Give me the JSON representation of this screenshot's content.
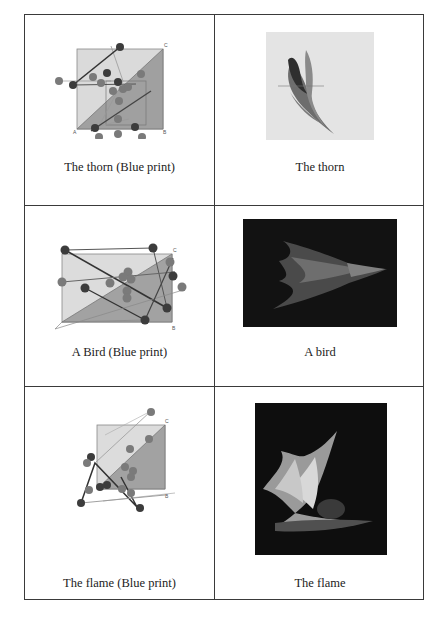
{
  "rows": [
    {
      "blueprint": {
        "caption": "The thorn (Blue print)",
        "icon": "blueprint-diagram"
      },
      "render": {
        "caption": "The thorn",
        "icon": "fractal-thorn-image",
        "background": "#e4e4e4"
      }
    },
    {
      "blueprint": {
        "caption": "A Bird (Blue print)",
        "icon": "blueprint-diagram"
      },
      "render": {
        "caption": "A bird",
        "icon": "fractal-bird-image",
        "background": "#111111"
      }
    },
    {
      "blueprint": {
        "caption": "The flame (Blue print)",
        "icon": "blueprint-diagram"
      },
      "render": {
        "caption": "The flame",
        "icon": "fractal-flame-image",
        "background": "#0e0e0e"
      }
    }
  ],
  "colors": {
    "border": "#3a3a3a",
    "light_fill": "#d8d8d8",
    "dark_fill": "#9a9a9a",
    "node": "#3c3c3c"
  }
}
